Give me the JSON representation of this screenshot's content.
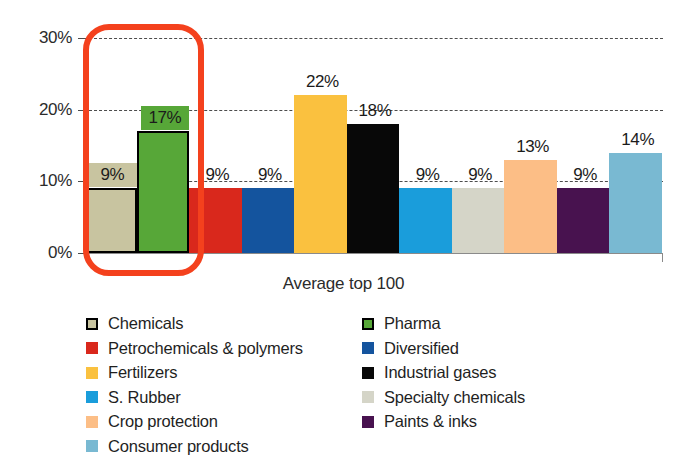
{
  "chart_data": {
    "type": "bar",
    "title": "",
    "xlabel": "Average top 100",
    "ylabel": "",
    "ylim": [
      0,
      30
    ],
    "yticks": [
      "0%",
      "10%",
      "20%",
      "30%"
    ],
    "ytick_values": [
      0,
      10,
      20,
      30
    ],
    "grid": "horizontal dashed gridlines at 10%, 20%, 30%",
    "legend_position": "below plot, two columns",
    "categories": [
      "Chemicals",
      "Pharma",
      "Petrochemicals & polymers",
      "Diversified",
      "Fertilizers",
      "Industrial gases",
      "S. Rubber",
      "Specialty chemicals",
      "Crop protection",
      "Paints & inks",
      "Consumer products"
    ],
    "values": [
      9,
      17,
      9,
      9,
      22,
      18,
      9,
      9,
      13,
      9,
      14
    ],
    "labels": [
      "9%",
      "17%",
      "9%",
      "9%",
      "22%",
      "18%",
      "9%",
      "9%",
      "13%",
      "9%",
      "14%"
    ],
    "colors": [
      "#c8c4a0",
      "#57a738",
      "#d9281c",
      "#14549e",
      "#fac13f",
      "#080808",
      "#1a9ddb",
      "#d5d5c8",
      "#fcbe86",
      "#48124f",
      "#79b9d2"
    ],
    "outlined_bars": [
      0,
      1
    ],
    "labels_on_swatch": [
      0,
      1
    ],
    "annotation": {
      "type": "rounded-rectangle-highlight",
      "color": "#f4411d",
      "covers": [
        "Chemicals",
        "Pharma"
      ]
    }
  },
  "legend": {
    "left_column": [
      {
        "label": "Chemicals",
        "color": "#c8c4a0",
        "bordered": true
      },
      {
        "label": "Petrochemicals & polymers",
        "color": "#d9281c",
        "bordered": false
      },
      {
        "label": "Fertilizers",
        "color": "#fac13f",
        "bordered": false
      },
      {
        "label": "S. Rubber",
        "color": "#1a9ddb",
        "bordered": false
      },
      {
        "label": "Crop protection",
        "color": "#fcbe86",
        "bordered": false
      },
      {
        "label": "Consumer products",
        "color": "#79b9d2",
        "bordered": false
      }
    ],
    "right_column": [
      {
        "label": "Pharma",
        "color": "#57a738",
        "bordered": true
      },
      {
        "label": "Diversified",
        "color": "#14549e",
        "bordered": false
      },
      {
        "label": "Industrial gases",
        "color": "#080808",
        "bordered": false
      },
      {
        "label": "Specialty chemicals",
        "color": "#d5d5c8",
        "bordered": false
      },
      {
        "label": "Paints & inks",
        "color": "#48124f",
        "bordered": false
      }
    ]
  }
}
